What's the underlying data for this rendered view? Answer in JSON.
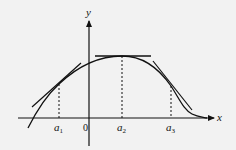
{
  "figure": {
    "axes": {
      "x_label": "x",
      "y_label": "y",
      "origin_label": "0"
    },
    "points": [
      {
        "id": "a1",
        "base": "a",
        "subscript": "1",
        "description": "tangent with positive slope"
      },
      {
        "id": "a2",
        "base": "a",
        "subscript": "2",
        "description": "horizontal tangent at maximum"
      },
      {
        "id": "a3",
        "base": "a",
        "subscript": "3",
        "description": "tangent with negative slope"
      }
    ],
    "colors": {
      "background": "#f2f2f2",
      "ink": "#111111"
    }
  }
}
